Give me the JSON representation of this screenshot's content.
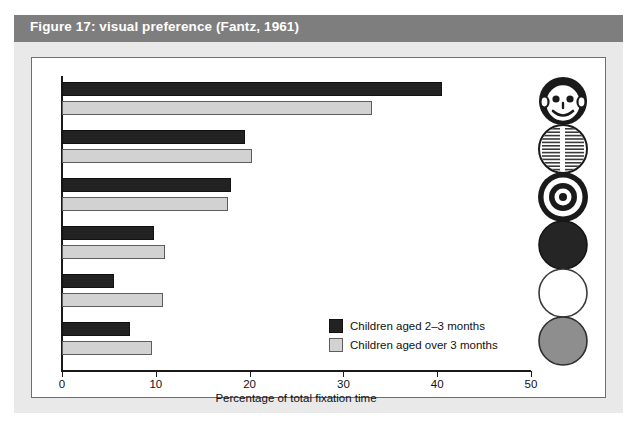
{
  "figure": {
    "title": "Figure 17: visual preference (Fantz, 1961)",
    "panel_bg": "#e9e9e9",
    "title_bar_color": "#7e7e7e",
    "plot_bg": "#ffffff"
  },
  "legend": {
    "position": "inside-right",
    "entries": [
      {
        "label": "Children aged 2–3 months",
        "color": "#222222",
        "swatch": "dark"
      },
      {
        "label": "Children aged over 3 months",
        "color": "#d2d2d2",
        "swatch": "light"
      }
    ]
  },
  "stimuli": [
    {
      "name": "face-stimulus-icon",
      "description": "smiling human face"
    },
    {
      "name": "newsprint-stimulus-icon",
      "description": "circle of printed text"
    },
    {
      "name": "bullseye-stimulus-icon",
      "description": "concentric rings target"
    },
    {
      "name": "solid-dark-disc-stimulus-icon",
      "description": "plain dark red/black disc"
    },
    {
      "name": "white-disc-stimulus-icon",
      "description": "plain white disc"
    },
    {
      "name": "gray-disc-stimulus-icon",
      "description": "plain gray disc"
    }
  ],
  "chart_data": {
    "type": "bar",
    "orientation": "horizontal",
    "title": "Figure 17: visual preference (Fantz, 1961)",
    "xlabel": "Percentage of total fixation time",
    "ylabel": "",
    "xlim": [
      0,
      50
    ],
    "xticks": [
      0,
      10,
      20,
      30,
      40,
      50
    ],
    "grid": false,
    "categories": [
      "Face",
      "Newsprint",
      "Bullseye",
      "Dark disc",
      "White disc",
      "Gray disc"
    ],
    "series": [
      {
        "name": "Children aged 2–3 months",
        "color": "#222222",
        "values": [
          40.5,
          19.5,
          18.0,
          9.8,
          5.5,
          7.2
        ]
      },
      {
        "name": "Children aged over 3 months",
        "color": "#d2d2d2",
        "values": [
          33.0,
          20.3,
          17.7,
          11.0,
          10.8,
          9.6
        ]
      }
    ]
  }
}
